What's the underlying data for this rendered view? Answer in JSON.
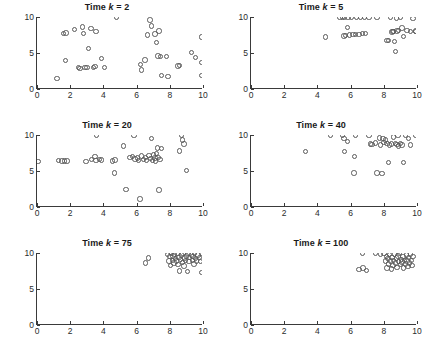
{
  "figure": {
    "layout": "2 columns x 3 rows",
    "marker_color": "#5a5a5a",
    "axis_color": "#3a3a3a",
    "background": "#ffffff"
  },
  "axis": {
    "xticks": [
      "0",
      "2",
      "4",
      "6",
      "8",
      "10"
    ],
    "xtick_values": [
      0,
      2,
      4,
      6,
      8,
      10
    ],
    "yticks": [
      "0",
      "5",
      "10"
    ],
    "ytick_values": [
      0,
      5,
      10
    ],
    "xlim": [
      0,
      10
    ],
    "ylim": [
      0,
      10
    ],
    "xlabel": "",
    "ylabel": ""
  },
  "chart_data": [
    {
      "type": "scatter",
      "title": "Time k = 2",
      "title_prefix": "Time ",
      "title_var": "k",
      "title_suffix": " = 2",
      "time_step": 2,
      "xlabel": "",
      "ylabel": "",
      "xlim": [
        0,
        10
      ],
      "ylim": [
        0,
        10
      ],
      "grid": false,
      "legend": "none",
      "points": [
        [
          1.2,
          1.5
        ],
        [
          1.6,
          7.7
        ],
        [
          1.75,
          7.8
        ],
        [
          1.7,
          4.0
        ],
        [
          2.25,
          8.3
        ],
        [
          2.5,
          3.0
        ],
        [
          2.6,
          2.85
        ],
        [
          2.75,
          8.6
        ],
        [
          2.8,
          7.7
        ],
        [
          2.9,
          3.0
        ],
        [
          3.0,
          2.95
        ],
        [
          3.1,
          5.65
        ],
        [
          3.25,
          8.4
        ],
        [
          3.4,
          2.95
        ],
        [
          3.5,
          3.1
        ],
        [
          3.55,
          8.0
        ],
        [
          3.9,
          4.25
        ],
        [
          4.05,
          3.0
        ],
        [
          4.8,
          9.95
        ],
        [
          6.25,
          3.4
        ],
        [
          6.3,
          2.65
        ],
        [
          6.5,
          4.05
        ],
        [
          6.65,
          7.5
        ],
        [
          6.8,
          9.6
        ],
        [
          6.9,
          8.75
        ],
        [
          7.1,
          7.65
        ],
        [
          7.2,
          6.45
        ],
        [
          7.3,
          4.6
        ],
        [
          7.35,
          8.05
        ],
        [
          7.45,
          4.55
        ],
        [
          7.5,
          1.85
        ],
        [
          7.8,
          4.5
        ],
        [
          7.9,
          1.75
        ],
        [
          8.5,
          3.2
        ],
        [
          8.6,
          3.25
        ],
        [
          9.3,
          5.05
        ],
        [
          9.55,
          4.35
        ],
        [
          9.9,
          7.2
        ],
        [
          9.95,
          3.65
        ],
        [
          9.95,
          1.85
        ]
      ]
    },
    {
      "type": "scatter",
      "title": "Time k = 5",
      "title_prefix": "Time ",
      "title_var": "k",
      "title_suffix": " = 5",
      "time_step": 5,
      "xlabel": "",
      "ylabel": "",
      "xlim": [
        0,
        10
      ],
      "ylim": [
        0,
        10
      ],
      "grid": false,
      "legend": "none",
      "points": [
        [
          4.5,
          7.2
        ],
        [
          5.35,
          9.95
        ],
        [
          5.5,
          9.95
        ],
        [
          5.6,
          7.35
        ],
        [
          5.65,
          9.95
        ],
        [
          5.7,
          7.45
        ],
        [
          5.8,
          8.55
        ],
        [
          5.85,
          9.95
        ],
        [
          5.95,
          7.5
        ],
        [
          6.05,
          9.95
        ],
        [
          6.15,
          7.55
        ],
        [
          6.3,
          7.6
        ],
        [
          6.35,
          9.95
        ],
        [
          6.5,
          7.6
        ],
        [
          6.6,
          9.95
        ],
        [
          6.7,
          7.7
        ],
        [
          6.85,
          9.95
        ],
        [
          6.9,
          7.75
        ],
        [
          7.1,
          9.95
        ],
        [
          7.6,
          9.95
        ],
        [
          8.2,
          6.7
        ],
        [
          8.3,
          6.75
        ],
        [
          8.4,
          9.95
        ],
        [
          8.5,
          7.9
        ],
        [
          8.55,
          8.0
        ],
        [
          8.6,
          7.95
        ],
        [
          8.65,
          6.6
        ],
        [
          8.7,
          5.2
        ],
        [
          8.75,
          9.85
        ],
        [
          8.8,
          8.05
        ],
        [
          8.9,
          8.1
        ],
        [
          9.0,
          9.9
        ],
        [
          9.1,
          8.5
        ],
        [
          9.2,
          7.3
        ],
        [
          9.4,
          8.1
        ],
        [
          9.6,
          8.0
        ],
        [
          9.75,
          9.8
        ],
        [
          9.9,
          7.95
        ],
        [
          9.95,
          8.05
        ]
      ]
    },
    {
      "type": "scatter",
      "title": "Time k = 20",
      "title_prefix": "Time ",
      "title_var": "k",
      "title_suffix": " = 20",
      "time_step": 20,
      "xlabel": "",
      "ylabel": "",
      "xlim": [
        0,
        10
      ],
      "ylim": [
        0,
        10
      ],
      "grid": false,
      "legend": "none",
      "points": [
        [
          0.05,
          6.3
        ],
        [
          1.3,
          6.45
        ],
        [
          1.5,
          6.4
        ],
        [
          1.65,
          6.4
        ],
        [
          1.8,
          6.4
        ],
        [
          2.95,
          6.3
        ],
        [
          3.3,
          6.6
        ],
        [
          3.5,
          7.0
        ],
        [
          3.55,
          6.45
        ],
        [
          3.6,
          9.95
        ],
        [
          3.75,
          6.6
        ],
        [
          3.9,
          6.55
        ],
        [
          4.55,
          6.4
        ],
        [
          4.65,
          4.75
        ],
        [
          4.7,
          6.55
        ],
        [
          5.2,
          8.45
        ],
        [
          5.35,
          2.4
        ],
        [
          5.6,
          6.85
        ],
        [
          5.75,
          7.0
        ],
        [
          5.85,
          9.95
        ],
        [
          5.9,
          6.65
        ],
        [
          6.05,
          6.8
        ],
        [
          6.1,
          6.5
        ],
        [
          6.2,
          1.1
        ],
        [
          6.3,
          7.1
        ],
        [
          6.4,
          6.6
        ],
        [
          6.55,
          6.9
        ],
        [
          6.6,
          6.45
        ],
        [
          6.75,
          7.15
        ],
        [
          6.85,
          6.7
        ],
        [
          6.9,
          9.5
        ],
        [
          6.95,
          6.5
        ],
        [
          7.0,
          7.25
        ],
        [
          7.1,
          6.8
        ],
        [
          7.15,
          6.4
        ],
        [
          7.2,
          7.4
        ],
        [
          7.25,
          8.2
        ],
        [
          7.3,
          6.85
        ],
        [
          7.35,
          2.35
        ],
        [
          7.4,
          6.6
        ],
        [
          7.5,
          8.15
        ],
        [
          8.6,
          7.8
        ],
        [
          8.7,
          9.9
        ],
        [
          8.75,
          9.3
        ],
        [
          8.85,
          8.75
        ],
        [
          9.0,
          5.1
        ]
      ]
    },
    {
      "type": "scatter",
      "title": "Time k = 40",
      "title_prefix": "Time ",
      "title_var": "k",
      "title_suffix": " = 40",
      "time_step": 40,
      "xlabel": "",
      "ylabel": "",
      "xlim": [
        0,
        10
      ],
      "ylim": [
        0,
        10
      ],
      "grid": false,
      "legend": "none",
      "points": [
        [
          3.3,
          7.75
        ],
        [
          4.8,
          9.9
        ],
        [
          5.5,
          9.95
        ],
        [
          5.6,
          9.5
        ],
        [
          5.65,
          7.75
        ],
        [
          5.8,
          9.1
        ],
        [
          6.2,
          4.7
        ],
        [
          6.25,
          7.0
        ],
        [
          6.3,
          9.9
        ],
        [
          7.1,
          9.95
        ],
        [
          7.2,
          8.75
        ],
        [
          7.3,
          8.7
        ],
        [
          7.5,
          8.9
        ],
        [
          7.6,
          4.75
        ],
        [
          7.75,
          9.6
        ],
        [
          7.8,
          8.6
        ],
        [
          7.9,
          4.65
        ],
        [
          7.95,
          9.5
        ],
        [
          8.0,
          8.95
        ],
        [
          8.1,
          9.3
        ],
        [
          8.2,
          8.85
        ],
        [
          8.3,
          6.2
        ],
        [
          8.35,
          8.6
        ],
        [
          8.45,
          8.75
        ],
        [
          8.6,
          9.7
        ],
        [
          8.7,
          8.8
        ],
        [
          8.8,
          8.65
        ],
        [
          8.85,
          9.9
        ],
        [
          8.9,
          8.5
        ],
        [
          9.0,
          8.85
        ],
        [
          9.1,
          8.6
        ],
        [
          9.2,
          6.2
        ],
        [
          9.3,
          9.95
        ],
        [
          9.5,
          9.5
        ],
        [
          9.6,
          8.6
        ],
        [
          9.9,
          9.95
        ]
      ]
    },
    {
      "type": "scatter",
      "title": "Time k = 75",
      "title_prefix": "Time ",
      "title_var": "k",
      "title_suffix": " = 75",
      "time_step": 75,
      "xlabel": "",
      "ylabel": "",
      "xlim": [
        0,
        10
      ],
      "ylim": [
        0,
        10
      ],
      "grid": false,
      "legend": "none",
      "points": [
        [
          6.55,
          8.6
        ],
        [
          6.7,
          9.3
        ],
        [
          7.85,
          9.8
        ],
        [
          7.95,
          8.9
        ],
        [
          8.0,
          9.5
        ],
        [
          8.05,
          8.3
        ],
        [
          8.1,
          9.9
        ],
        [
          8.15,
          9.0
        ],
        [
          8.2,
          9.6
        ],
        [
          8.25,
          8.6
        ],
        [
          8.3,
          9.85
        ],
        [
          8.35,
          9.2
        ],
        [
          8.4,
          8.9
        ],
        [
          8.45,
          9.95
        ],
        [
          8.5,
          8.4
        ],
        [
          8.55,
          9.4
        ],
        [
          8.6,
          7.5
        ],
        [
          8.65,
          9.1
        ],
        [
          8.7,
          9.7
        ],
        [
          8.75,
          8.7
        ],
        [
          8.8,
          9.95
        ],
        [
          8.85,
          8.2
        ],
        [
          8.9,
          9.3
        ],
        [
          8.95,
          8.95
        ],
        [
          9.0,
          9.6
        ],
        [
          9.05,
          7.4
        ],
        [
          9.1,
          9.9
        ],
        [
          9.15,
          8.8
        ],
        [
          9.2,
          9.35
        ],
        [
          9.3,
          9.75
        ],
        [
          9.35,
          9.0
        ],
        [
          9.4,
          9.55
        ],
        [
          9.45,
          8.5
        ],
        [
          9.5,
          9.9
        ],
        [
          9.55,
          9.2
        ],
        [
          9.6,
          8.9
        ],
        [
          9.7,
          9.7
        ],
        [
          9.8,
          9.4
        ],
        [
          9.85,
          8.8
        ],
        [
          9.9,
          9.9
        ],
        [
          9.95,
          7.3
        ]
      ]
    },
    {
      "type": "scatter",
      "title": "Time k = 100",
      "title_prefix": "Time ",
      "title_var": "k",
      "title_suffix": " = 100",
      "time_step": 100,
      "xlabel": "",
      "ylabel": "",
      "xlim": [
        0,
        10
      ],
      "ylim": [
        0,
        10
      ],
      "grid": false,
      "legend": "none",
      "points": [
        [
          6.5,
          7.7
        ],
        [
          6.7,
          9.9
        ],
        [
          6.75,
          7.9
        ],
        [
          6.95,
          7.6
        ],
        [
          7.5,
          9.9
        ],
        [
          7.8,
          9.85
        ],
        [
          8.0,
          9.9
        ],
        [
          8.1,
          8.9
        ],
        [
          8.15,
          9.5
        ],
        [
          8.2,
          7.9
        ],
        [
          8.25,
          9.2
        ],
        [
          8.3,
          8.5
        ],
        [
          8.35,
          9.8
        ],
        [
          8.4,
          8.9
        ],
        [
          8.45,
          7.8
        ],
        [
          8.5,
          9.4
        ],
        [
          8.55,
          8.3
        ],
        [
          8.6,
          9.0
        ],
        [
          8.65,
          9.85
        ],
        [
          8.7,
          8.6
        ],
        [
          8.75,
          9.3
        ],
        [
          8.8,
          8.0
        ],
        [
          8.85,
          9.6
        ],
        [
          8.9,
          8.85
        ],
        [
          8.95,
          9.9
        ],
        [
          9.0,
          8.4
        ],
        [
          9.05,
          9.1
        ],
        [
          9.1,
          8.75
        ],
        [
          9.15,
          9.5
        ],
        [
          9.2,
          7.9
        ],
        [
          9.25,
          9.0
        ],
        [
          9.3,
          8.5
        ],
        [
          9.35,
          9.7
        ],
        [
          9.4,
          8.9
        ],
        [
          9.45,
          8.1
        ],
        [
          9.5,
          9.35
        ],
        [
          9.55,
          8.6
        ],
        [
          9.6,
          9.85
        ],
        [
          9.65,
          9.0
        ],
        [
          9.7,
          8.3
        ],
        [
          9.75,
          9.5
        ]
      ]
    }
  ]
}
